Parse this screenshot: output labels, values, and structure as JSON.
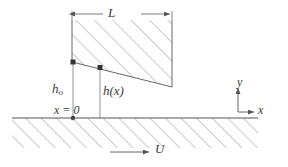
{
  "figure": {
    "stroke_color": "#555555",
    "hatch_color": "#8a8a8a",
    "text_color": "#3a3a3a",
    "background": "#ffffff"
  },
  "labels": {
    "length": "L",
    "h_zero_base": "h",
    "h_zero_sub": "o",
    "h_of_x": "h(x)",
    "origin": "x = 0",
    "axis_y": "y",
    "axis_x": "x",
    "velocity": "U"
  },
  "geometry": {
    "wedge": {
      "left_x": 72,
      "right_x": 172,
      "top_y": 20,
      "bottom_left_y": 62,
      "bottom_right_y": 87
    },
    "ground": {
      "line_y": 118,
      "start_x": 12,
      "end_x": 258,
      "hatch_bottom_y": 148
    },
    "h_zero_line_x": 73,
    "h_of_x_line_x": 100,
    "dimension_line_y": 14,
    "axes_origin": {
      "x": 238,
      "y": 112
    },
    "velocity_arrow": {
      "start_x": 110,
      "end_x": 148,
      "y": 152
    }
  }
}
